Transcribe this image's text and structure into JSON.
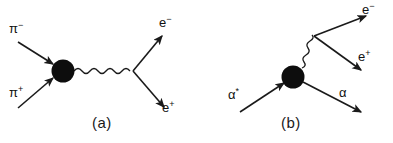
{
  "figure": {
    "background_color": "#ffffff",
    "ink_color": "#1a1a1a",
    "width": 393,
    "height": 143,
    "panels": [
      {
        "id": "a",
        "caption": "(a)",
        "blob_label": "interaction-blob",
        "incoming": [
          {
            "name": "pi-minus",
            "symbol": "π",
            "charge": "−"
          },
          {
            "name": "pi-plus",
            "symbol": "π",
            "charge": "+"
          }
        ],
        "propagator": "photon-wavy-line",
        "outgoing": [
          {
            "name": "electron",
            "symbol": "e",
            "charge": "−"
          },
          {
            "name": "positron",
            "symbol": "e",
            "charge": "+"
          }
        ]
      },
      {
        "id": "b",
        "caption": "(b)",
        "blob_label": "interaction-blob",
        "incoming": [
          {
            "name": "alpha-excited",
            "symbol": "α",
            "charge": "*"
          }
        ],
        "propagator": "photon-wavy-line",
        "outgoing": [
          {
            "name": "alpha",
            "symbol": "α",
            "charge": ""
          },
          {
            "name": "electron",
            "symbol": "e",
            "charge": "−"
          },
          {
            "name": "positron",
            "symbol": "e",
            "charge": "+"
          }
        ]
      }
    ]
  },
  "labels": {
    "a_pi_minus_base": "π",
    "a_pi_minus_sup": "−",
    "a_pi_plus_base": "π",
    "a_pi_plus_sup": "+",
    "a_electron_base": "e",
    "a_electron_sup": "−",
    "a_positron_base": "e",
    "a_positron_sup": "+",
    "a_caption": "(a)",
    "b_alpha_star_base": "α",
    "b_alpha_star_sup": "*",
    "b_alpha_base": "α",
    "b_alpha_sup": "",
    "b_electron_base": "e",
    "b_electron_sup": "−",
    "b_positron_base": "e",
    "b_positron_sup": "+",
    "b_caption": "(b)"
  }
}
